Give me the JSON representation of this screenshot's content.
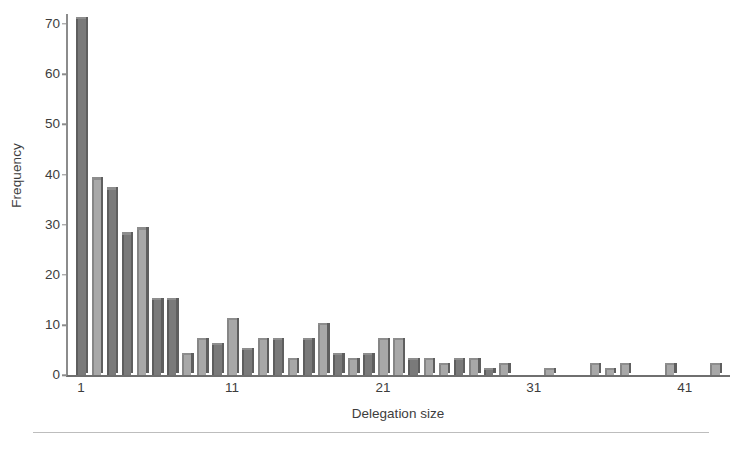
{
  "chart_data": {
    "type": "bar",
    "title": "",
    "subtitle": "",
    "xlabel": "Delegation size",
    "ylabel": "Frequency",
    "xlim": [
      0,
      44
    ],
    "ylim": [
      0,
      72
    ],
    "grid": false,
    "legend": null,
    "x_ticks": [
      1,
      11,
      21,
      31,
      41
    ],
    "x_tick_labels": [
      "1",
      "11",
      "21",
      "31",
      "41"
    ],
    "y_ticks": [
      0,
      10,
      20,
      30,
      40,
      50,
      60,
      70
    ],
    "y_tick_labels": [
      "0",
      "10",
      "20",
      "30",
      "40",
      "50",
      "60",
      "70"
    ],
    "bar_style": "3d-shaded-grey",
    "colors": {
      "bar_light": "#a8a8a8",
      "bar_dark": "#7a7a7a",
      "bar_top": "#8d8d8d",
      "bar_side": "#5f5f5f",
      "axis": "#6f6f6f",
      "text": "#3d3d3d",
      "rule": "#bdbdbd",
      "background": "#ffffff"
    },
    "categories": [
      1,
      2,
      3,
      4,
      5,
      6,
      7,
      8,
      9,
      10,
      11,
      12,
      13,
      14,
      15,
      16,
      17,
      18,
      19,
      20,
      21,
      22,
      23,
      24,
      25,
      26,
      27,
      28,
      29,
      30,
      31,
      32,
      33,
      34,
      35,
      36,
      37,
      38,
      39,
      40,
      41,
      42,
      43
    ],
    "values": [
      71,
      39,
      37,
      28,
      29,
      15,
      15,
      4,
      7,
      6,
      11,
      5,
      7,
      7,
      3,
      7,
      10,
      4,
      3,
      4,
      7,
      7,
      3,
      3,
      2,
      3,
      3,
      1,
      2,
      0,
      0,
      1,
      0,
      0,
      2,
      1,
      2,
      0,
      0,
      2,
      0,
      0,
      2
    ],
    "bar_shades": [
      "dark",
      "light",
      "dark",
      "dark",
      "light",
      "dark",
      "dark",
      "light",
      "light",
      "dark",
      "light",
      "dark",
      "light",
      "dark",
      "light",
      "dark",
      "light",
      "dark",
      "light",
      "dark",
      "light",
      "light",
      "dark",
      "light",
      "light",
      "dark",
      "light",
      "dark",
      "light",
      "light",
      "light",
      "light",
      "light",
      "light",
      "light",
      "light",
      "light",
      "light",
      "light",
      "light",
      "light",
      "light",
      "light"
    ]
  },
  "axes": {
    "ylabel": "Frequency",
    "xlabel": "Delegation size"
  }
}
